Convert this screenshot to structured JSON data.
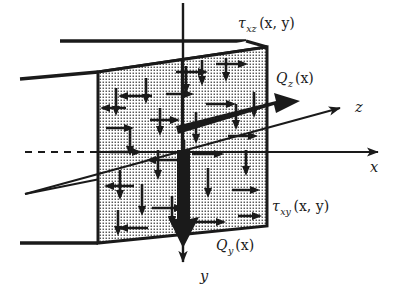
{
  "figure": {
    "type": "engineering-diagram"
  },
  "labels": {
    "tau_xz": {
      "symbol": "τ",
      "subscript": "xz",
      "argument": "(x, y)",
      "full": "τxz(x, y)"
    },
    "tau_xy": {
      "symbol": "τ",
      "subscript": "xy",
      "argument": "(x, y)",
      "full": "τxy(x, y)"
    },
    "Q_z": {
      "symbol": "Q",
      "subscript": "z",
      "argument": "(x)",
      "full": "Qz(x)"
    },
    "Q_y": {
      "symbol": "Q",
      "subscript": "y",
      "argument": "(x)",
      "full": "Qy(x)"
    }
  },
  "axes": {
    "x": {
      "label": "x",
      "direction": "right",
      "style": "thin-line-with-arrow"
    },
    "y": {
      "label": "y",
      "direction": "down",
      "style": "thin-line-with-arrow"
    },
    "z": {
      "label": "z",
      "direction": "up-right",
      "style": "thin-line-with-arrow"
    }
  },
  "resultants": [
    {
      "name": "Qz",
      "direction": "up-right",
      "style": "bold-solid-arrow"
    },
    {
      "name": "Qy",
      "direction": "down",
      "style": "bold-solid-arrow"
    }
  ],
  "colors": {
    "ink": "#1a1a1a",
    "background": "#ffffff",
    "stipple": "#1a1a1a"
  },
  "geometry": {
    "front_face": "parallelogram cross-section, stipple filled",
    "stipple_pitch_px": 3,
    "neutral_axis": "dashed horizontal centerline at left"
  }
}
